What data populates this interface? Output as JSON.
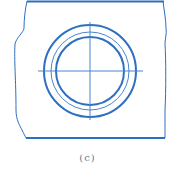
{
  "figure": {
    "caption": "(c)",
    "colors": {
      "line": "#2f6fc0",
      "thin_line": "#4a85d0",
      "caption": "#6b7a8f",
      "background": "#ffffff"
    },
    "center": {
      "x": 90,
      "y": 71
    },
    "circles": [
      {
        "name": "outer",
        "r": 46,
        "stroke_width": 2
      },
      {
        "name": "middle",
        "r": 39,
        "stroke_width": 1
      },
      {
        "name": "inner",
        "r": 34,
        "stroke_width": 2
      }
    ],
    "centerlines": {
      "horizontal": {
        "x1": 38,
        "x2": 143,
        "y": 71
      },
      "vertical": {
        "x": 90,
        "y1": 22,
        "y2": 120
      }
    }
  }
}
